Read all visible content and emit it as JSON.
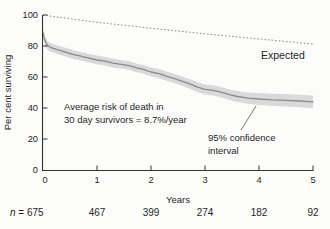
{
  "colors": {
    "background": "#fcfcfa",
    "axis": "#333333",
    "text": "#1f1f1f",
    "expected_line": "#9c9c9c",
    "observed_line": "#8a8a8a",
    "confidence_band": "#d9d9d9",
    "callout_line": "#555555"
  },
  "chart_data": {
    "type": "line",
    "title": "",
    "ylabel": "Per cent surviving",
    "xlabel": "Years",
    "xlim": [
      0,
      5
    ],
    "ylim": [
      0,
      100
    ],
    "x_ticks": [
      0,
      1,
      2,
      3,
      4,
      5
    ],
    "y_ticks": [
      0,
      20,
      40,
      60,
      80,
      100
    ],
    "grid": false,
    "legend_position": "none",
    "series": [
      {
        "name": "Expected",
        "line_style": "dotted",
        "color": "#9c9c9c",
        "points": [
          [
            0,
            100
          ],
          [
            0.5,
            97.6
          ],
          [
            1,
            95.3
          ],
          [
            1.5,
            93.4
          ],
          [
            2,
            91.5
          ],
          [
            2.5,
            89.7
          ],
          [
            3,
            87.9
          ],
          [
            3.5,
            86.2
          ],
          [
            4,
            84.5
          ],
          [
            4.5,
            82.9
          ],
          [
            5,
            81.3
          ]
        ]
      },
      {
        "name": "",
        "line_style": "solid",
        "color": "#8a8a8a",
        "band_color": "#d9d9d9",
        "points_format": [
          "years",
          "percent_surviving",
          "ci_halfwidth"
        ],
        "points": [
          [
            0.0,
            88.5,
            3.0
          ],
          [
            0.03,
            84.0,
            3.0
          ],
          [
            0.08,
            80.5,
            2.8
          ],
          [
            0.15,
            79.0,
            2.8
          ],
          [
            0.25,
            77.8,
            2.8
          ],
          [
            0.4,
            76.2,
            2.8
          ],
          [
            0.55,
            74.6,
            2.8
          ],
          [
            0.7,
            73.4,
            2.8
          ],
          [
            0.85,
            72.2,
            2.8
          ],
          [
            1.0,
            71.0,
            2.8
          ],
          [
            1.15,
            70.2,
            2.8
          ],
          [
            1.3,
            69.0,
            2.8
          ],
          [
            1.45,
            68.2,
            2.8
          ],
          [
            1.6,
            67.3,
            2.8
          ],
          [
            1.72,
            66.0,
            2.8
          ],
          [
            1.86,
            64.9,
            2.8
          ],
          [
            2.0,
            63.2,
            2.9
          ],
          [
            2.15,
            62.2,
            3.0
          ],
          [
            2.3,
            60.4,
            3.0
          ],
          [
            2.45,
            58.8,
            3.0
          ],
          [
            2.6,
            57.0,
            3.0
          ],
          [
            2.73,
            55.4,
            3.1
          ],
          [
            2.85,
            53.6,
            3.2
          ],
          [
            3.0,
            52.0,
            3.2
          ],
          [
            3.15,
            51.4,
            3.3
          ],
          [
            3.3,
            50.2,
            3.4
          ],
          [
            3.45,
            48.6,
            3.4
          ],
          [
            3.6,
            47.4,
            3.5
          ],
          [
            3.8,
            46.4,
            3.6
          ],
          [
            4.0,
            45.8,
            3.8
          ],
          [
            4.25,
            45.3,
            3.9
          ],
          [
            4.5,
            45.0,
            4.0
          ],
          [
            4.75,
            44.5,
            4.0
          ],
          [
            5.0,
            44.0,
            4.1
          ]
        ]
      }
    ],
    "annotations": [
      {
        "id": "average-risk",
        "lines": [
          "Average risk of death in",
          "30 day survivors = 8.7%/year"
        ]
      },
      {
        "id": "confidence-interval",
        "lines": [
          "95% confidence",
          "interval"
        ]
      }
    ],
    "at_risk": {
      "symbol": "n",
      "separator": " = ",
      "values": [
        "675",
        "467",
        "399",
        "274",
        "182",
        "92"
      ]
    }
  }
}
